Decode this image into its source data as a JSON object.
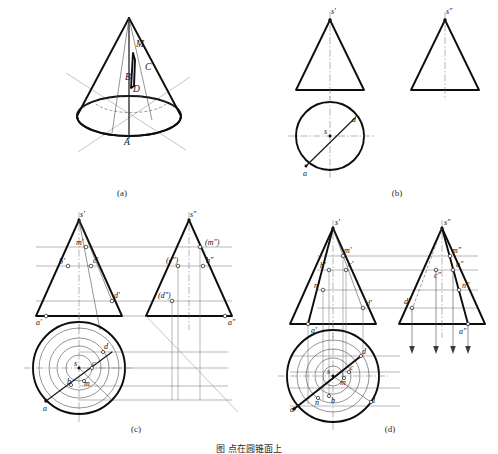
{
  "document": {
    "title": "Descriptive Geometry — Cone Surface Point Construction",
    "figure_caption": "图 点在圆锥面上"
  },
  "panels": [
    {
      "id": "a",
      "caption": "(a)",
      "description": "Pictorial view of a cone with a section plane and points A, B, C, D, M marked on the surface",
      "labels": [
        {
          "text": "M",
          "x": 136,
          "y": 47
        },
        {
          "text": "C",
          "x": 145,
          "y": 70
        },
        {
          "text": "B",
          "x": 125,
          "y": 80
        },
        {
          "text": "D",
          "x": 133,
          "y": 92
        },
        {
          "text": "A",
          "x": 124,
          "y": 145
        }
      ]
    },
    {
      "id": "b",
      "caption": "(b)",
      "description": "Three-view projection of the cone: front view triangle, side view triangle, top view circle with line sa",
      "labels": [
        {
          "text": "s'",
          "x": 331,
          "y": 14
        },
        {
          "text": "s\"",
          "x": 446,
          "y": 14
        },
        {
          "text": "s",
          "x": 326,
          "y": 134
        },
        {
          "text": "a",
          "x": 309,
          "y": 172
        },
        {
          "text": "d",
          "x": 354,
          "y": 124
        }
      ]
    },
    {
      "id": "c",
      "caption": "(c)",
      "description": "Auxiliary-circle method: front view, side view and top view with projection lines and 45 degree mitre line",
      "labels": [
        {
          "text": "s'",
          "x": 80,
          "y": 215
        },
        {
          "text": "s\"",
          "x": 190,
          "y": 215
        },
        {
          "text": "m'",
          "x": 79,
          "y": 243
        },
        {
          "text": "(m\")",
          "x": 206,
          "y": 244
        },
        {
          "text": "b'",
          "x": 61,
          "y": 262
        },
        {
          "text": "c'",
          "x": 94,
          "y": 261
        },
        {
          "text": "(c\")",
          "x": 172,
          "y": 262
        },
        {
          "text": "b\"",
          "x": 208,
          "y": 263
        },
        {
          "text": "d'",
          "x": 117,
          "y": 297
        },
        {
          "text": "(d\")",
          "x": 163,
          "y": 296
        },
        {
          "text": "a'",
          "x": 36,
          "y": 322
        },
        {
          "text": "a\"",
          "x": 233,
          "y": 322
        },
        {
          "text": "s",
          "x": 76,
          "y": 363
        },
        {
          "text": "d",
          "x": 103,
          "y": 348
        },
        {
          "text": "c",
          "x": 93,
          "y": 364
        },
        {
          "text": "b",
          "x": 72,
          "y": 382
        },
        {
          "text": "m",
          "x": 85,
          "y": 382
        },
        {
          "text": "a",
          "x": 52,
          "y": 412
        }
      ]
    },
    {
      "id": "d",
      "caption": "(d)",
      "description": "Element-line (generatrix) method: front view, side view and top view with arrow projection lines",
      "labels": [
        {
          "text": "s'",
          "x": 335,
          "y": 222
        },
        {
          "text": "s\"",
          "x": 444,
          "y": 222
        },
        {
          "text": "m'",
          "x": 343,
          "y": 252
        },
        {
          "text": "m\"",
          "x": 451,
          "y": 254
        },
        {
          "text": "b'",
          "x": 325,
          "y": 265
        },
        {
          "text": "c'",
          "x": 347,
          "y": 266
        },
        {
          "text": "c\"",
          "x": 440,
          "y": 270
        },
        {
          "text": "b\"",
          "x": 456,
          "y": 267
        },
        {
          "text": "n'",
          "x": 317,
          "y": 286
        },
        {
          "text": "n\"",
          "x": 464,
          "y": 287
        },
        {
          "text": "d'",
          "x": 366,
          "y": 304
        },
        {
          "text": "d\"",
          "x": 418,
          "y": 302
        },
        {
          "text": "a'",
          "x": 317,
          "y": 324
        },
        {
          "text": "a\"",
          "x": 460,
          "y": 330
        },
        {
          "text": "s",
          "x": 326,
          "y": 373
        },
        {
          "text": "d",
          "x": 360,
          "y": 355
        },
        {
          "text": "c",
          "x": 350,
          "y": 371
        },
        {
          "text": "m",
          "x": 345,
          "y": 381
        },
        {
          "text": "b",
          "x": 332,
          "y": 399
        },
        {
          "text": "n",
          "x": 318,
          "y": 400
        },
        {
          "text": "a",
          "x": 294,
          "y": 404
        },
        {
          "text": "1",
          "x": 372,
          "y": 400
        }
      ]
    }
  ],
  "panel_captions": {
    "a": "(a)",
    "b": "(b)",
    "c": "(c)",
    "d": "(d)"
  },
  "colors": {
    "outline": "#0d0d0d",
    "thin_line": "#3d3d3d",
    "projection_line": "#6f6f6f",
    "center_line": "#6a6a6a",
    "background": "#ffffff"
  }
}
